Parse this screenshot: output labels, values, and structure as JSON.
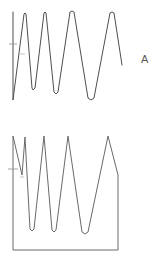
{
  "figure": {
    "background_color": "#ffffff",
    "stroke_color": "#4f4f50",
    "width": 165,
    "height": 270
  },
  "panels": [
    {
      "id": "panel-a",
      "label": "A",
      "label_position": {
        "x": 141,
        "y": 54
      }
    },
    {
      "id": "panel-w",
      "label": "w",
      "label_position": {
        "x": 141,
        "y": 185
      }
    }
  ],
  "chart_data": [
    {
      "type": "line",
      "title": "A",
      "panel": "panel-a",
      "xlabel": "",
      "ylabel": "",
      "grid": false,
      "legend": null,
      "axis_visible": false,
      "xlim": [
        0,
        165
      ],
      "ylim": [
        0,
        135
      ],
      "description": "Open damped oscillatory trace: a tall vertical left edge followed by five sharp peaks of decreasing frequency, each peak slightly rounded, with troughs deepening toward the right.",
      "points": [
        [
          13,
          12
        ],
        [
          13,
          100
        ],
        [
          13,
          100
        ],
        [
          24,
          14
        ],
        [
          24,
          14
        ],
        [
          25,
          13
        ],
        [
          26,
          14
        ],
        [
          26,
          14
        ],
        [
          32,
          88
        ],
        [
          32,
          88
        ],
        [
          33,
          90
        ],
        [
          35,
          88
        ],
        [
          35,
          88
        ],
        [
          44,
          13
        ],
        [
          44,
          13
        ],
        [
          45,
          12
        ],
        [
          46,
          13
        ],
        [
          46,
          13
        ],
        [
          54,
          92
        ],
        [
          54,
          92
        ],
        [
          56,
          94
        ],
        [
          58,
          92
        ],
        [
          58,
          92
        ],
        [
          70,
          12
        ],
        [
          70,
          12
        ],
        [
          72,
          11
        ],
        [
          74,
          12
        ],
        [
          74,
          12
        ],
        [
          88,
          98
        ],
        [
          88,
          98
        ],
        [
          91,
          100
        ],
        [
          94,
          98
        ],
        [
          94,
          98
        ],
        [
          110,
          13
        ],
        [
          110,
          13
        ],
        [
          112,
          12
        ],
        [
          114,
          13
        ],
        [
          114,
          13
        ],
        [
          122,
          65
        ]
      ],
      "annotations": [
        {
          "name": "left-tick-upper",
          "x1": 9,
          "y1": 44,
          "x2": 17,
          "y2": 44
        },
        {
          "name": "left-tick-lower",
          "x1": 20,
          "y1": 54,
          "x2": 25,
          "y2": 54
        }
      ]
    },
    {
      "type": "area",
      "title": "w",
      "panel": "panel-w",
      "xlabel": "",
      "ylabel": "",
      "grid": false,
      "legend": null,
      "axis_visible": true,
      "xlim": [
        0,
        165
      ],
      "ylim": [
        0,
        135
      ],
      "description": "Closed sawtooth-like waveform filled to a baseline: left vertical edge rises to top, four sharp triangular peaks of increasing width, then a vertical right edge down to the baseline which closes the region.",
      "baseline_y": 250,
      "left_edge_x": 13,
      "right_edge_x": 118,
      "points": [
        [
          13,
          250
        ],
        [
          13,
          136
        ],
        [
          13,
          136
        ],
        [
          22,
          175
        ],
        [
          22,
          175
        ],
        [
          25,
          137
        ],
        [
          25,
          137
        ],
        [
          30,
          229
        ],
        [
          30,
          229
        ],
        [
          32,
          231
        ],
        [
          34,
          229
        ],
        [
          34,
          229
        ],
        [
          44,
          136
        ],
        [
          44,
          136
        ],
        [
          52,
          230
        ],
        [
          52,
          230
        ],
        [
          54,
          232
        ],
        [
          56,
          230
        ],
        [
          56,
          230
        ],
        [
          68,
          136
        ],
        [
          68,
          136
        ],
        [
          82,
          232
        ],
        [
          82,
          232
        ],
        [
          85,
          234
        ],
        [
          88,
          232
        ],
        [
          88,
          232
        ],
        [
          108,
          136
        ],
        [
          108,
          136
        ],
        [
          118,
          175
        ],
        [
          118,
          175
        ],
        [
          118,
          250
        ],
        [
          118,
          250
        ],
        [
          13,
          250
        ]
      ],
      "annotations": [
        {
          "name": "left-tick-upper",
          "x1": 8,
          "y1": 169,
          "x2": 18,
          "y2": 169
        },
        {
          "name": "left-tick-lower",
          "x1": 20,
          "y1": 177,
          "x2": 24,
          "y2": 177
        }
      ]
    }
  ]
}
